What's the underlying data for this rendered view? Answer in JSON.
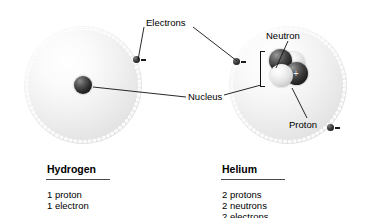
{
  "figure": {
    "background_color": "#ffffff",
    "line_color": "#111111"
  },
  "callouts": {
    "electrons": "Electrons",
    "nucleus": "Nucleus",
    "neutron": "Neutron",
    "proton": "Proton"
  },
  "atoms": [
    {
      "id": "hydrogen",
      "name": "Hydrogen",
      "composition": [
        "1 proton",
        "1 electron"
      ],
      "electron_count": 1,
      "proton_count": 1,
      "neutron_count": 0
    },
    {
      "id": "helium",
      "name": "Helium",
      "composition": [
        "2 protons",
        "2 neutrons",
        "2 electrons"
      ],
      "electron_count": 2,
      "proton_count": 2,
      "neutron_count": 2
    }
  ],
  "particle_signs": {
    "electron": "−",
    "proton": "+"
  }
}
